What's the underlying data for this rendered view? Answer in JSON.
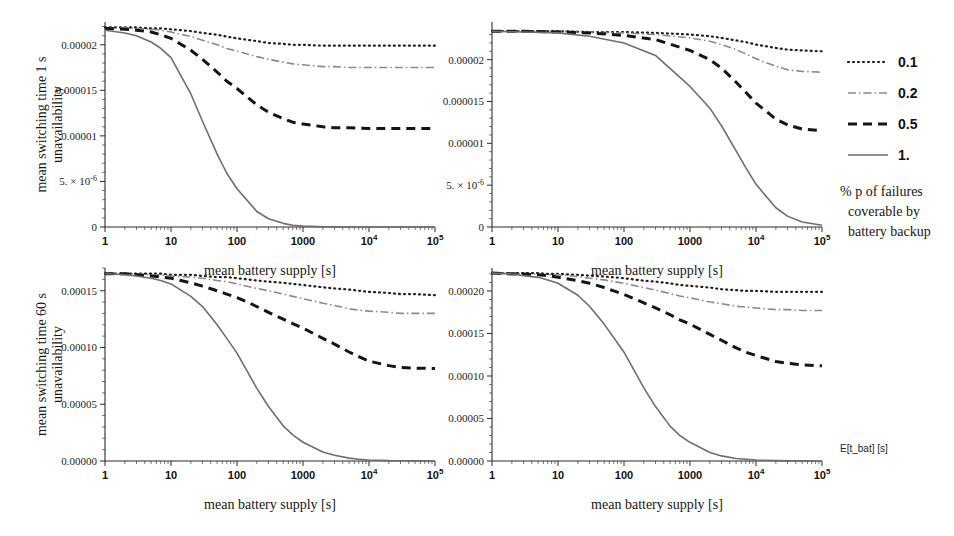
{
  "figure": {
    "background": "#ffffff",
    "legend": {
      "entries": [
        {
          "label": "0.1",
          "style": "dotted",
          "color": "#1f1f1f",
          "width": 2.2,
          "dash": "1,4"
        },
        {
          "label": "0.2",
          "style": "dashdot",
          "color": "#8a8a8a",
          "width": 1.6,
          "dash": "8,3,1.5,3"
        },
        {
          "label": "0.5",
          "style": "dashed",
          "color": "#151515",
          "width": 3.0,
          "dash": "9,6"
        },
        {
          "label": "1.",
          "style": "solid",
          "color": "#6e6e6e",
          "width": 1.6,
          "dash": "none"
        }
      ],
      "caption_lines": [
        "% p of failures",
        "coverable by",
        "battery backup"
      ]
    },
    "corner_axis_label": "E[t_bat] [s]",
    "shared": {
      "xlabel": "mean battery supply [s]",
      "xticks": [
        {
          "value": 1,
          "label": "1"
        },
        {
          "value": 10,
          "label": "10"
        },
        {
          "value": 100,
          "label": "100"
        },
        {
          "value": 1000,
          "label": "1000"
        },
        {
          "value": 10000,
          "label": "10",
          "sup": "4"
        },
        {
          "value": 100000,
          "label": "10",
          "sup": "5"
        }
      ],
      "xlim": [
        1,
        100000
      ],
      "xscale": "log"
    }
  },
  "chart_data": [
    {
      "id": "panel-top-left",
      "type": "line",
      "title": "",
      "ylabel_lines": [
        "mean switching time 1 s",
        "unavailability"
      ],
      "xlabel": "mean battery supply [s]",
      "xscale": "log",
      "xlim": [
        1,
        100000
      ],
      "ylim": [
        0,
        2.25e-05
      ],
      "yticks": [
        {
          "value": 0,
          "label": "0"
        },
        {
          "value": 5e-06,
          "label": "5. × 10",
          "sup": "-6"
        },
        {
          "value": 1e-05,
          "label": "0.00001"
        },
        {
          "value": 1.5e-05,
          "label": "0.000015"
        },
        {
          "value": 2e-05,
          "label": "0.00002"
        }
      ],
      "x": [
        1,
        2,
        3,
        5,
        7,
        10,
        20,
        30,
        50,
        70,
        100,
        200,
        300,
        500,
        700,
        1000,
        2000,
        3000,
        5000,
        10000,
        30000,
        100000
      ],
      "series": [
        {
          "name": "0.1",
          "values": [
            2.19e-05,
            2.19e-05,
            2.19e-05,
            2.18e-05,
            2.18e-05,
            2.17e-05,
            2.15e-05,
            2.13e-05,
            2.11e-05,
            2.09e-05,
            2.07e-05,
            2.04e-05,
            2.02e-05,
            2.01e-05,
            2e-05,
            2e-05,
            1.99e-05,
            1.99e-05,
            1.99e-05,
            1.99e-05,
            1.99e-05,
            1.99e-05
          ]
        },
        {
          "name": "0.2",
          "values": [
            2.19e-05,
            2.19e-05,
            2.18e-05,
            2.17e-05,
            2.16e-05,
            2.14e-05,
            2.09e-05,
            2.05e-05,
            2e-05,
            1.96e-05,
            1.93e-05,
            1.87e-05,
            1.84e-05,
            1.81e-05,
            1.79e-05,
            1.78e-05,
            1.76e-05,
            1.76e-05,
            1.75e-05,
            1.75e-05,
            1.75e-05,
            1.75e-05
          ]
        },
        {
          "name": "0.5",
          "values": [
            2.18e-05,
            2.17e-05,
            2.16e-05,
            2.14e-05,
            2.11e-05,
            2.07e-05,
            1.94e-05,
            1.84e-05,
            1.7e-05,
            1.6e-05,
            1.52e-05,
            1.34e-05,
            1.26e-05,
            1.19e-05,
            1.15e-05,
            1.13e-05,
            1.1e-05,
            1.09e-05,
            1.09e-05,
            1.08e-05,
            1.08e-05,
            1.08e-05
          ]
        },
        {
          "name": "1.",
          "values": [
            2.16e-05,
            2.13e-05,
            2.1e-05,
            2.03e-05,
            1.96e-05,
            1.86e-05,
            1.46e-05,
            1.16e-05,
            8e-06,
            5.9e-06,
            4.2e-06,
            1.7e-06,
            9e-07,
            4e-07,
            2e-07,
            1e-07,
            3e-08,
            1e-08,
            0.0,
            0.0,
            0.0,
            0.0
          ]
        }
      ]
    },
    {
      "id": "panel-top-right",
      "type": "line",
      "title": "",
      "ylabel_lines": [],
      "xlabel": "mean battery supply [s]",
      "xscale": "log",
      "xlim": [
        1,
        100000
      ],
      "ylim": [
        0,
        2.45e-05
      ],
      "yticks": [
        {
          "value": 0,
          "label": "0"
        },
        {
          "value": 5e-06,
          "label": "5. × 10",
          "sup": "-6"
        },
        {
          "value": 1e-05,
          "label": "0.00001"
        },
        {
          "value": 1.5e-05,
          "label": "0.000015"
        },
        {
          "value": 2e-05,
          "label": "0.00002"
        }
      ],
      "x": [
        1,
        3,
        10,
        30,
        100,
        300,
        1000,
        2000,
        3000,
        5000,
        7000,
        10000,
        20000,
        30000,
        50000,
        100000
      ],
      "series": [
        {
          "name": "0.1",
          "values": [
            2.34e-05,
            2.34e-05,
            2.34e-05,
            2.33e-05,
            2.33e-05,
            2.32e-05,
            2.3e-05,
            2.28e-05,
            2.26e-05,
            2.23e-05,
            2.21e-05,
            2.18e-05,
            2.14e-05,
            2.12e-05,
            2.11e-05,
            2.1e-05
          ]
        },
        {
          "name": "0.2",
          "values": [
            2.34e-05,
            2.34e-05,
            2.34e-05,
            2.33e-05,
            2.32e-05,
            2.3e-05,
            2.26e-05,
            2.22e-05,
            2.18e-05,
            2.12e-05,
            2.07e-05,
            2.01e-05,
            1.92e-05,
            1.88e-05,
            1.86e-05,
            1.85e-05
          ]
        },
        {
          "name": "0.5",
          "values": [
            2.34e-05,
            2.34e-05,
            2.33e-05,
            2.32e-05,
            2.29e-05,
            2.24e-05,
            2.11e-05,
            2e-05,
            1.9e-05,
            1.73e-05,
            1.61e-05,
            1.48e-05,
            1.29e-05,
            1.22e-05,
            1.17e-05,
            1.15e-05
          ]
        },
        {
          "name": "1.",
          "values": [
            2.34e-05,
            2.33e-05,
            2.32e-05,
            2.28e-05,
            2.2e-05,
            2.05e-05,
            1.68e-05,
            1.42e-05,
            1.21e-05,
            9.1e-06,
            7.1e-06,
            5.1e-06,
            2.3e-06,
            1.3e-06,
            6e-07,
            2e-07
          ]
        }
      ]
    },
    {
      "id": "panel-bottom-left",
      "type": "line",
      "title": "",
      "ylabel_lines": [
        "mean switching time 60 s",
        "unavailability"
      ],
      "xlabel": "mean battery supply [s]",
      "xscale": "log",
      "xlim": [
        1,
        100000
      ],
      "ylim": [
        0,
        0.00017
      ],
      "yticks": [
        {
          "value": 0,
          "label": "0.00000"
        },
        {
          "value": 5e-05,
          "label": "0.00005"
        },
        {
          "value": 0.0001,
          "label": "0.00010"
        },
        {
          "value": 0.00015,
          "label": "0.00015"
        }
      ],
      "x": [
        1,
        2,
        3,
        5,
        7,
        10,
        20,
        30,
        50,
        70,
        100,
        200,
        300,
        500,
        700,
        1000,
        2000,
        3000,
        5000,
        7000,
        10000,
        20000,
        30000,
        50000,
        100000
      ],
      "series": [
        {
          "name": "0.1",
          "values": [
            0.000165,
            0.000165,
            0.000165,
            0.000165,
            0.000165,
            0.000164,
            0.000164,
            0.000163,
            0.000162,
            0.000162,
            0.000161,
            0.000159,
            0.000158,
            0.000157,
            0.000156,
            0.000155,
            0.000153,
            0.000152,
            0.000151,
            0.00015,
            0.000149,
            0.000148,
            0.000147,
            0.000147,
            0.000146
          ]
        },
        {
          "name": "0.2",
          "values": [
            0.000165,
            0.000165,
            0.000165,
            0.000164,
            0.000164,
            0.000163,
            0.000162,
            0.000161,
            0.000159,
            0.000158,
            0.000156,
            0.000152,
            0.00015,
            0.000147,
            0.000145,
            0.000143,
            0.000139,
            0.000137,
            0.000134,
            0.000133,
            0.000132,
            0.000131,
            0.00013,
            0.00013,
            0.00013
          ]
        },
        {
          "name": "0.5",
          "values": [
            0.000165,
            0.000165,
            0.000164,
            0.000163,
            0.000162,
            0.000161,
            0.000157,
            0.000154,
            0.00015,
            0.000147,
            0.000144,
            0.000136,
            0.000131,
            0.000125,
            0.000121,
            0.000117,
            0.000108,
            0.000103,
            9.6e-05,
            9.2e-05,
            8.8e-05,
            8.4e-05,
            8.25e-05,
            8.18e-05,
            8.15e-05
          ]
        },
        {
          "name": "1.",
          "values": [
            0.000165,
            0.000164,
            0.000163,
            0.000161,
            0.000159,
            0.000156,
            0.000145,
            0.000136,
            0.00012,
            0.000108,
            9.5e-05,
            6.4e-05,
            4.8e-05,
            3.1e-05,
            2.3e-05,
            1.65e-05,
            8e-06,
            5e-06,
            2.5e-06,
            1.6e-06,
            9e-07,
            3e-07,
            2e-07,
            1e-07,
            0.0
          ]
        }
      ]
    },
    {
      "id": "panel-bottom-right",
      "type": "line",
      "title": "",
      "ylabel_lines": [],
      "xlabel": "mean battery supply [s]",
      "xscale": "log",
      "xlim": [
        1,
        100000
      ],
      "ylim": [
        0,
        0.000227
      ],
      "yticks": [
        {
          "value": 0,
          "label": "0.00000"
        },
        {
          "value": 5e-05,
          "label": "0.00005"
        },
        {
          "value": 0.0001,
          "label": "0.00010"
        },
        {
          "value": 0.00015,
          "label": "0.00015"
        },
        {
          "value": 0.0002,
          "label": "0.00020"
        }
      ],
      "x": [
        1,
        2,
        3,
        5,
        7,
        10,
        20,
        30,
        50,
        70,
        100,
        200,
        300,
        500,
        700,
        1000,
        2000,
        3000,
        5000,
        7000,
        10000,
        20000,
        30000,
        50000,
        100000
      ],
      "series": [
        {
          "name": "0.1",
          "values": [
            0.000221,
            0.000221,
            0.000221,
            0.000221,
            0.00022,
            0.00022,
            0.000219,
            0.000218,
            0.000217,
            0.000216,
            0.000215,
            0.000212,
            0.000211,
            0.000209,
            0.000207,
            0.000206,
            0.000204,
            0.000202,
            0.000201,
            0.0002,
            0.0002,
            0.000199,
            0.000199,
            0.000199,
            0.000199
          ]
        },
        {
          "name": "0.2",
          "values": [
            0.000221,
            0.000221,
            0.00022,
            0.00022,
            0.000219,
            0.000219,
            0.000217,
            0.000215,
            0.000213,
            0.000211,
            0.000209,
            0.000204,
            0.000201,
            0.000197,
            0.000194,
            0.000192,
            0.000187,
            0.000185,
            0.000182,
            0.000181,
            0.00018,
            0.000178,
            0.000178,
            0.000177,
            0.000177
          ]
        },
        {
          "name": "0.5",
          "values": [
            0.000221,
            0.00022,
            0.00022,
            0.000219,
            0.000218,
            0.000216,
            0.000212,
            0.000209,
            0.000204,
            0.0002,
            0.000196,
            0.000186,
            0.00018,
            0.000172,
            0.000166,
            0.000161,
            0.000149,
            0.000142,
            0.000133,
            0.000128,
            0.000124,
            0.000117,
            0.000115,
            0.000113,
            0.000112
          ]
        },
        {
          "name": "1.",
          "values": [
            0.000221,
            0.00022,
            0.000218,
            0.000216,
            0.000213,
            0.000209,
            0.000195,
            0.000182,
            0.000161,
            0.000145,
            0.000128,
            8.6e-05,
            6.4e-05,
            4.1e-05,
            3e-05,
            2.2e-05,
            1e-05,
            6e-06,
            3e-06,
            2e-06,
            1.2e-06,
            4e-07,
            2e-07,
            1e-07,
            0.0
          ]
        }
      ]
    }
  ]
}
